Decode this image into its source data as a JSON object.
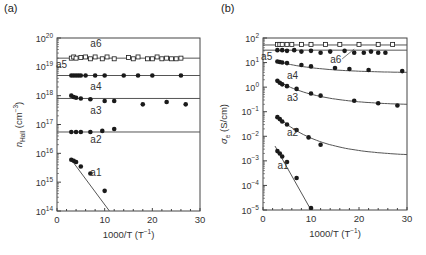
{
  "chart_data": [
    {
      "panel": "(a)",
      "type": "scatter",
      "xlabel": "1000/T (T⁻¹)",
      "ylabel": "n_Hall (cm⁻³)",
      "xlim": [
        0,
        30
      ],
      "ylim": [
        100000000000000.0,
        1e+20
      ],
      "yscale": "log",
      "xticks": [
        "0",
        "10",
        "20",
        "30"
      ],
      "yticks": [
        "10^14",
        "10^15",
        "10^16",
        "10^17",
        "10^18",
        "10^19",
        "10^20"
      ],
      "series": [
        {
          "name": "a6",
          "marker": "open-square",
          "x": [
            3,
            3.5,
            4,
            5,
            6,
            7,
            8,
            9.5,
            10.5,
            12,
            15,
            16,
            17,
            19,
            20,
            21,
            22,
            23,
            24,
            25,
            26
          ],
          "y": [
            2e+19,
            2.2e+19,
            2e+19,
            2.1e+19,
            2.2e+19,
            1.9e+19,
            2.2e+19,
            1.9e+19,
            2.2e+19,
            1.9e+19,
            2.1e+19,
            1.9e+19,
            2.2e+19,
            1.9e+19,
            1.9e+19,
            2.2e+19,
            1.9e+19,
            2e+19,
            1.9e+19,
            1.9e+19,
            2e+19
          ],
          "fit": {
            "type": "constant",
            "value": 2e+19
          }
        },
        {
          "name": "a5",
          "marker": "filled-circle",
          "x": [
            3,
            3.5,
            4,
            4.5,
            5,
            6,
            8,
            10,
            14,
            17,
            20,
            26
          ],
          "y": [
            5e+18,
            5e+18,
            5e+18,
            5e+18,
            5e+18,
            5e+18,
            5e+18,
            5e+18,
            5e+18,
            5e+18,
            5e+18,
            5e+18
          ],
          "fit": {
            "type": "constant",
            "value": 5e+18
          }
        },
        {
          "name": "a3",
          "marker": "filled-circle",
          "x": [
            3,
            3.5,
            4,
            5,
            7,
            10,
            12,
            18,
            23,
            27
          ],
          "y": [
            1e+18,
            9e+17,
            8.5e+17,
            8e+17,
            7.5e+17,
            6.5e+17,
            6.5e+17,
            5e+17,
            6e+17,
            5e+17
          ],
          "fit": {
            "type": "constant",
            "value": 8e+17
          }
        },
        {
          "name": "a2",
          "marker": "filled-circle",
          "x": [
            3,
            4,
            5,
            7,
            9.5,
            12
          ],
          "y": [
            5.5e+16,
            5.5e+16,
            5.5e+16,
            5.5e+16,
            6e+16,
            7e+16
          ],
          "fit": {
            "type": "constant",
            "value": 5.5e+16
          }
        },
        {
          "name": "a1",
          "marker": "filled-circle",
          "x": [
            3,
            3.5,
            4,
            5,
            7,
            10
          ],
          "y": [
            6000000000000000.0,
            5500000000000000.0,
            5000000000000000.0,
            3500000000000000.0,
            2000000000000000.0,
            500000000000000.0
          ],
          "fit": {
            "type": "linear-log",
            "from": [
              3,
              6000000000000000.0
            ],
            "to": [
              11,
              100000000000000.0
            ]
          }
        }
      ],
      "annotations": [
        "a6",
        "a5",
        "a4",
        "a3",
        "a2",
        "a1"
      ]
    },
    {
      "panel": "(b)",
      "type": "scatter",
      "xlabel": "1000/T (T⁻¹)",
      "ylabel": "σ_e (S/cm)",
      "xlim": [
        0,
        30
      ],
      "ylim": [
        1e-05,
        100.0
      ],
      "yscale": "log",
      "xticks": [
        "0",
        "10",
        "20",
        "30"
      ],
      "yticks": [
        "10^-5",
        "10^-4",
        "10^-3",
        "10^-2",
        "10^-1",
        "10^0",
        "10^1",
        "10^2"
      ],
      "series": [
        {
          "name": "a6",
          "marker": "open-square",
          "x": [
            3,
            3.5,
            4,
            5,
            6,
            8,
            10,
            13,
            16,
            20,
            24,
            27
          ],
          "y": [
            55,
            55,
            55,
            55,
            55,
            55,
            55,
            55,
            55,
            55,
            55,
            55
          ],
          "fit": {
            "type": "constant",
            "value": 52
          }
        },
        {
          "name": "a5",
          "marker": "filled-circle",
          "x": [
            3,
            4,
            5,
            6.5,
            8,
            10,
            12,
            14,
            17,
            19,
            21,
            22.5,
            24,
            25.5
          ],
          "y": [
            32,
            32,
            30,
            32,
            28,
            30,
            25,
            28,
            30,
            25,
            25,
            28,
            25,
            25
          ],
          "fit": {
            "type": "constant",
            "value": 32
          }
        },
        {
          "name": "a4",
          "marker": "filled-circle",
          "x": [
            3,
            3.5,
            4,
            5,
            8,
            10,
            15,
            18,
            22,
            29
          ],
          "y": [
            11,
            10.5,
            10,
            9.5,
            8,
            7,
            6,
            5.5,
            5,
            4.5
          ],
          "fit": {
            "type": "curve",
            "from": [
              3,
              11
            ],
            "to": [
              30,
              4
            ]
          }
        },
        {
          "name": "a3",
          "marker": "filled-circle",
          "x": [
            3,
            3.5,
            4,
            5,
            7,
            10,
            12,
            19,
            24,
            28
          ],
          "y": [
            1.8,
            1.5,
            1.3,
            1.1,
            0.85,
            0.55,
            0.45,
            0.28,
            0.22,
            0.18
          ],
          "fit": {
            "type": "curve",
            "from": [
              3,
              1.8
            ],
            "to": [
              30,
              0.2
            ]
          }
        },
        {
          "name": "a2",
          "marker": "filled-circle",
          "x": [
            3,
            3.5,
            4,
            5,
            7,
            9.5,
            12
          ],
          "y": [
            0.06,
            0.05,
            0.04,
            0.03,
            0.018,
            0.009,
            0.0045
          ],
          "fit": {
            "type": "curve",
            "from": [
              3,
              0.065
            ],
            "to": [
              30,
              0.0018
            ]
          }
        },
        {
          "name": "a1",
          "marker": "filled-circle",
          "x": [
            3,
            3.5,
            4,
            5,
            7,
            10
          ],
          "y": [
            0.0025,
            0.002,
            0.0015,
            0.0009,
            0.0002,
            1.2e-05
          ],
          "fit": {
            "type": "linear-log",
            "from": [
              2.5,
              0.004
            ],
            "to": [
              10,
              1e-05
            ]
          }
        }
      ],
      "annotations": [
        "a6",
        "a5",
        "a4",
        "a3",
        "a2",
        "a1"
      ]
    }
  ],
  "figure": {
    "panel_a_label": "(a)",
    "panel_b_label": "(b)",
    "panel_a": {
      "ylabel_main": "n",
      "ylabel_sub": "Hall",
      "ylabel_unit": " (cm",
      "ylabel_exp": "−3",
      "ylabel_close": ")",
      "xlabel": "1000/T (T",
      "xlabel_exp": "−1",
      "xlabel_close": ")",
      "yticks": [
        {
          "base": "10",
          "exp": "20"
        },
        {
          "base": "10",
          "exp": "19"
        },
        {
          "base": "10",
          "exp": "18"
        },
        {
          "base": "10",
          "exp": "17"
        },
        {
          "base": "10",
          "exp": "16"
        },
        {
          "base": "10",
          "exp": "15"
        },
        {
          "base": "10",
          "exp": "14"
        }
      ],
      "xticks": [
        "0",
        "10",
        "20",
        "30"
      ],
      "labels": {
        "a6": "a6",
        "a5": "a5",
        "a4": "a4",
        "a3": "a3",
        "a2": "a2",
        "a1": "a1"
      }
    },
    "panel_b": {
      "ylabel_main": "σ",
      "ylabel_sub": "e",
      "ylabel_unit": " (S/cm)",
      "xlabel": "1000/T (T",
      "xlabel_exp": "−1",
      "xlabel_close": ")",
      "yticks": [
        {
          "base": "10",
          "exp": "2"
        },
        {
          "base": "10",
          "exp": "1"
        },
        {
          "base": "10",
          "exp": "0"
        },
        {
          "base": "10",
          "exp": "−1"
        },
        {
          "base": "10",
          "exp": "−2"
        },
        {
          "base": "10",
          "exp": "−3"
        },
        {
          "base": "10",
          "exp": "−4"
        },
        {
          "base": "10",
          "exp": "−5"
        }
      ],
      "xticks": [
        "0",
        "10",
        "20",
        "30"
      ],
      "labels": {
        "a6": "a6",
        "a5": "a5",
        "a4": "a4",
        "a3": "a3",
        "a2": "a2",
        "a1": "a1"
      }
    },
    "colors": {
      "axis": "#444444",
      "marker": "#1a1a1a",
      "line": "#555555",
      "text": "#333333"
    }
  }
}
